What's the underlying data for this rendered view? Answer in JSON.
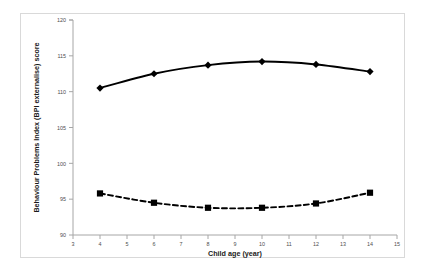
{
  "chart_data": {
    "type": "line",
    "title": "",
    "xlabel": "Child age (year)",
    "ylabel": "Behaviour Problems Index (BPI externalise) score",
    "xlim": [
      3,
      15
    ],
    "ylim": [
      90,
      120
    ],
    "xticks": [
      3,
      4,
      5,
      6,
      7,
      8,
      9,
      10,
      11,
      12,
      13,
      14,
      15
    ],
    "yticks": [
      90,
      95,
      100,
      105,
      110,
      115,
      120
    ],
    "xtick_labels": [
      "3",
      "4",
      "5",
      "6",
      "7",
      "8",
      "9",
      "10",
      "11",
      "12",
      "13",
      "14",
      "15"
    ],
    "ytick_labels": [
      "90",
      "95",
      "100",
      "105",
      "110",
      "115",
      "120"
    ],
    "grid": false,
    "legend": "none",
    "x": [
      4,
      6,
      8,
      10,
      12,
      14
    ],
    "series": [
      {
        "name": "solid-series",
        "line_style": "solid",
        "marker": "diamond",
        "color": "#000000",
        "values": [
          110.5,
          112.5,
          113.7,
          114.2,
          113.8,
          112.8
        ]
      },
      {
        "name": "dashed-series",
        "line_style": "dashed",
        "marker": "square",
        "color": "#000000",
        "values": [
          95.8,
          94.5,
          93.8,
          93.8,
          94.4,
          95.9
        ]
      }
    ]
  },
  "axes": {
    "x_title": "Child age (year)",
    "y_title": "Behaviour Problems Index (BPI externalise) score"
  },
  "ticks": {
    "y": [
      "120",
      "115",
      "110",
      "105",
      "100",
      "95",
      "90"
    ],
    "x": [
      "3",
      "4",
      "5",
      "6",
      "7",
      "8",
      "9",
      "10",
      "11",
      "12",
      "13",
      "14",
      "15"
    ]
  },
  "colors": {
    "line": "#000000",
    "axis": "#a6a6a6",
    "frame": "#d9d9d9",
    "tick_text": "#4d4d4d",
    "title_text": "#1a1a1a"
  }
}
